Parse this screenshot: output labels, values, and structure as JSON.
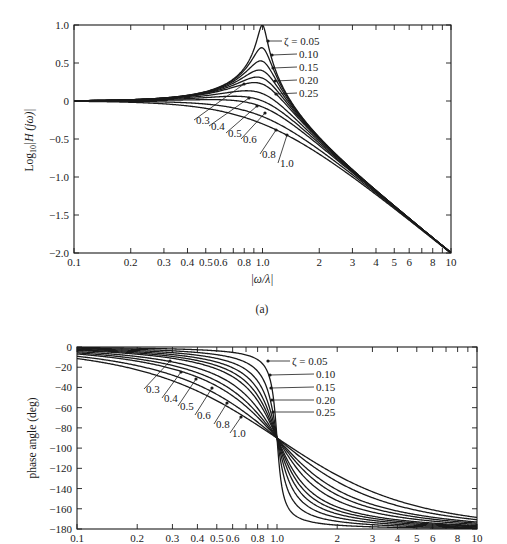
{
  "chart_data": [
    {
      "type": "line",
      "panel_label": "(a)",
      "title": "",
      "xlabel": "|ω/λ|",
      "ylabel": "Log10|H(jω)|",
      "xscale": "log",
      "xlim": [
        0.1,
        10
      ],
      "ylim": [
        -2.0,
        1.0
      ],
      "grid": false,
      "x_tick_labels": [
        "0.1",
        "0.2",
        "0.3",
        "0.4",
        "0.5",
        "0.6",
        "0.8",
        "1.0",
        "2",
        "3",
        "4",
        "5",
        "6",
        "8",
        "10"
      ],
      "x_ticks": [
        0.1,
        0.2,
        0.3,
        0.4,
        0.5,
        0.6,
        0.8,
        1.0,
        2,
        3,
        4,
        5,
        6,
        8,
        10
      ],
      "y_tick_labels": [
        "1.0",
        "0.5",
        "0",
        "-0.5",
        "-1.0",
        "-1.5",
        "-2.0"
      ],
      "y_ticks": [
        1.0,
        0.5,
        0,
        -0.5,
        -1.0,
        -1.5,
        -2.0
      ],
      "series_param": "ζ",
      "series": [
        {
          "name": "ζ = 0.05",
          "zeta": 0.05,
          "peak_at_x_1": 1.0
        },
        {
          "name": "0.10",
          "zeta": 0.1,
          "peak_at_x_1": 0.699
        },
        {
          "name": "0.15",
          "zeta": 0.15,
          "peak_at_x_1": 0.523
        },
        {
          "name": "0.20",
          "zeta": 0.2,
          "peak_at_x_1": 0.398
        },
        {
          "name": "0.25",
          "zeta": 0.25,
          "peak_at_x_1": 0.301
        },
        {
          "name": "0.3",
          "zeta": 0.3,
          "peak_at_x_1": 0.222
        },
        {
          "name": "0.4",
          "zeta": 0.4,
          "peak_at_x_1": 0.097
        },
        {
          "name": "0.5",
          "zeta": 0.5,
          "peak_at_x_1": 0.0
        },
        {
          "name": "0.6",
          "zeta": 0.6,
          "peak_at_x_1": -0.079
        },
        {
          "name": "0.8",
          "zeta": 0.8,
          "peak_at_x_1": -0.204
        },
        {
          "name": "1.0",
          "zeta": 1.0,
          "peak_at_x_1": -0.301
        }
      ],
      "formula": "log10 |1 / (1 - u^2 + 2jζu)|, u = |ω/λ|",
      "annotations_right": [
        "ζ = 0.05",
        "0.10",
        "0.15",
        "0.20",
        "0.25"
      ],
      "annotations_lower": [
        "0.3",
        "0.4",
        "0.5",
        "0.6",
        "0.8",
        "1.0"
      ]
    },
    {
      "type": "line",
      "panel_label": "",
      "title": "",
      "xlabel": "",
      "ylabel": "phase angle (deg)",
      "xscale": "log",
      "xlim": [
        0.1,
        10
      ],
      "ylim": [
        -180,
        0
      ],
      "grid": false,
      "x_tick_labels": [
        "0.1",
        "0.2",
        "0.3",
        "0.4",
        "0.5",
        "0.6",
        "0.8",
        "1.0",
        "2",
        "3",
        "4",
        "5",
        "6",
        "8",
        "10"
      ],
      "x_ticks": [
        0.1,
        0.2,
        0.3,
        0.4,
        0.5,
        0.6,
        0.8,
        1.0,
        2,
        3,
        4,
        5,
        6,
        8,
        10
      ],
      "y_tick_labels": [
        "0",
        "-20",
        "-40",
        "-60",
        "-80",
        "-100",
        "-120",
        "-140",
        "-160",
        "-180"
      ],
      "y_ticks": [
        0,
        -20,
        -40,
        -60,
        -80,
        -100,
        -120,
        -140,
        -160,
        -180
      ],
      "series_param": "ζ",
      "series": [
        {
          "name": "ζ = 0.05",
          "zeta": 0.05
        },
        {
          "name": "0.10",
          "zeta": 0.1
        },
        {
          "name": "0.15",
          "zeta": 0.15
        },
        {
          "name": "0.20",
          "zeta": 0.2
        },
        {
          "name": "0.25",
          "zeta": 0.25
        },
        {
          "name": "0.3",
          "zeta": 0.3
        },
        {
          "name": "0.4",
          "zeta": 0.4
        },
        {
          "name": "0.5",
          "zeta": 0.5
        },
        {
          "name": "0.6",
          "zeta": 0.6
        },
        {
          "name": "0.8",
          "zeta": 0.8
        },
        {
          "name": "1.0",
          "zeta": 1.0
        }
      ],
      "formula": "-atan2(2ζu, 1 - u^2) in degrees; all curves pass -90 at u = 1",
      "annotations_right": [
        "ζ = 0.05",
        "0.10",
        "0.15",
        "0.20",
        "0.25"
      ],
      "annotations_lower": [
        "0.3",
        "0.4",
        "0.5",
        "0.6",
        "0.8",
        "1.0"
      ]
    }
  ],
  "labels": {
    "top_ylabel_main": "Log",
    "top_ylabel_sub": "10",
    "top_ylabel_rest": "|H (jω)|",
    "top_xlabel": "|ω/λ|",
    "panel_a": "(a)",
    "bottom_ylabel": "phase angle (deg)"
  }
}
